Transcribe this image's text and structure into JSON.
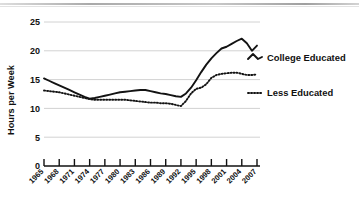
{
  "chart_data": {
    "type": "line",
    "title": "",
    "xlabel": "",
    "ylabel": "Hours per Week",
    "ylim": [
      0,
      25
    ],
    "yticks": [
      0,
      5,
      10,
      15,
      20,
      25
    ],
    "xlim": [
      1965,
      2007
    ],
    "xticks": [
      1965,
      1968,
      1971,
      1974,
      1977,
      1980,
      1983,
      1986,
      1989,
      1992,
      1995,
      1998,
      2001,
      2004,
      2007
    ],
    "xtick_labels": [
      "1965",
      "1968",
      "1971",
      "1974",
      "1977",
      "1980",
      "1983",
      "1986",
      "1989",
      "1992",
      "1995",
      "1998",
      "2001",
      "2004",
      "2007"
    ],
    "grid": "horizontal",
    "legend_position": "right-inline",
    "x": [
      1965,
      1966,
      1967,
      1968,
      1969,
      1970,
      1971,
      1972,
      1973,
      1974,
      1975,
      1976,
      1977,
      1978,
      1979,
      1980,
      1981,
      1982,
      1983,
      1984,
      1985,
      1986,
      1987,
      1988,
      1989,
      1990,
      1991,
      1992,
      1993,
      1994,
      1995,
      1996,
      1997,
      1998,
      1999,
      2000,
      2001,
      2002,
      2003,
      2004,
      2005,
      2006,
      2007
    ],
    "series": [
      {
        "name": "College Educated",
        "style": "solid",
        "color": "#131313",
        "values": [
          15.2,
          14.8,
          14.4,
          14.0,
          13.6,
          13.2,
          12.8,
          12.4,
          12.0,
          11.7,
          11.8,
          12.0,
          12.2,
          12.4,
          12.6,
          12.8,
          12.9,
          13.0,
          13.1,
          13.2,
          13.2,
          13.0,
          12.8,
          12.6,
          12.5,
          12.3,
          12.1,
          12.0,
          12.6,
          13.6,
          14.9,
          16.3,
          17.6,
          18.7,
          19.6,
          20.4,
          20.7,
          21.2,
          21.7,
          22.1,
          21.3,
          20.0,
          20.9
        ]
      },
      {
        "name": "Less Educated",
        "style": "dotted",
        "color": "#131313",
        "values": [
          13.1,
          13.0,
          12.9,
          12.8,
          12.6,
          12.4,
          12.2,
          12.0,
          11.8,
          11.6,
          11.5,
          11.5,
          11.5,
          11.5,
          11.5,
          11.5,
          11.5,
          11.4,
          11.3,
          11.2,
          11.1,
          11.0,
          11.0,
          10.9,
          10.9,
          10.8,
          10.6,
          10.4,
          11.3,
          12.6,
          13.4,
          13.6,
          14.2,
          15.3,
          15.8,
          16.0,
          16.1,
          16.2,
          16.2,
          16.0,
          15.8,
          15.8,
          15.9
        ]
      }
    ],
    "legend": [
      {
        "label": "College Educated",
        "style": "solid"
      },
      {
        "label": "Less Educated",
        "style": "dotted"
      }
    ]
  },
  "colors": {
    "ink": "#131313",
    "gridline": "#d2d2d2",
    "axis": "#111111",
    "background": "#ffffff"
  }
}
